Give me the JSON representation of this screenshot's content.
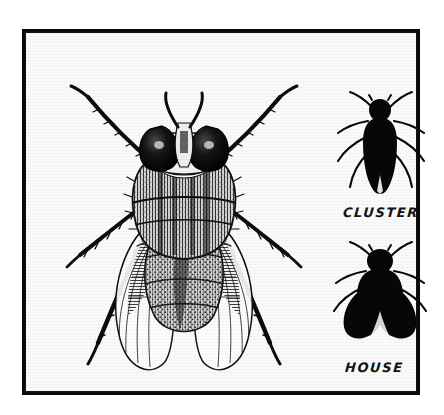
{
  "illustration": {
    "title": "Fly identification plate",
    "medium": "pen-and-ink line drawing",
    "palette": {
      "ink": "#0b0b0b",
      "paper": "#fbfbfb",
      "page": "#ffffff"
    },
    "frame": {
      "name": "hand-drawn rectangular border",
      "stroke_color": "#0b0b0b"
    }
  },
  "specimens": [
    {
      "id": "detail-fly",
      "label": "",
      "style": "detailed stippled line drawing",
      "description": "large fly viewed from above with compound eyes, hairy thorax, veined wings and six bristled legs",
      "parts": [
        "compound-eyes",
        "antennae",
        "thorax",
        "abdomen",
        "wings",
        "legs"
      ]
    },
    {
      "id": "cluster-fly",
      "label": "CLUSTER",
      "style": "solid black silhouette",
      "description": "narrow elongated body with wings folded close over the abdomen"
    },
    {
      "id": "house-fly",
      "label": "HOUSE",
      "style": "solid black silhouette",
      "description": "broader rounded body with wings spread wider apart"
    }
  ],
  "labels": {
    "cluster": "CLUSTER",
    "house": "HOUSE"
  }
}
